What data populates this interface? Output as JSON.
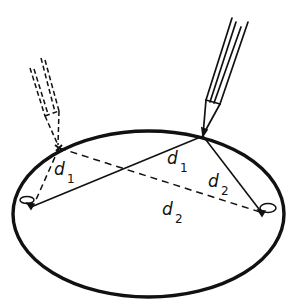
{
  "diagram": {
    "colors": {
      "ink": "#111111",
      "background": "#ffffff"
    },
    "labels": {
      "d1_left": {
        "main": "d",
        "sub": "1"
      },
      "d1_right": {
        "main": "d",
        "sub": "1"
      },
      "d2_right": {
        "main": "d",
        "sub": "2"
      },
      "d2_bottom": {
        "main": "d",
        "sub": "2"
      }
    },
    "elements": {
      "ellipse": "ellipse-outline",
      "pencil_solid": "pencil-icon",
      "pencil_dashed": "pencil-ghost-icon",
      "pin_left": "pin-icon",
      "pin_right": "pin-icon"
    }
  }
}
